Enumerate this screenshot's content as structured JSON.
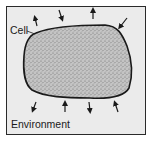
{
  "diagram": {
    "labels": {
      "cell": "Cell",
      "environment": "Environment"
    },
    "colors": {
      "background": "#ebebeb",
      "border": "#2a2a2a",
      "cell_fill": "#b9b9b9",
      "ink": "#1a1a1a"
    },
    "arrows": [
      {
        "position": "top-left",
        "direction": "outward"
      },
      {
        "position": "top-center-left",
        "direction": "inward"
      },
      {
        "position": "top-center-right",
        "direction": "outward"
      },
      {
        "position": "top-right",
        "direction": "inward"
      },
      {
        "position": "bottom-left",
        "direction": "outward"
      },
      {
        "position": "bottom-center-left",
        "direction": "inward"
      },
      {
        "position": "bottom-center-right",
        "direction": "outward"
      },
      {
        "position": "bottom-right",
        "direction": "inward"
      }
    ]
  }
}
